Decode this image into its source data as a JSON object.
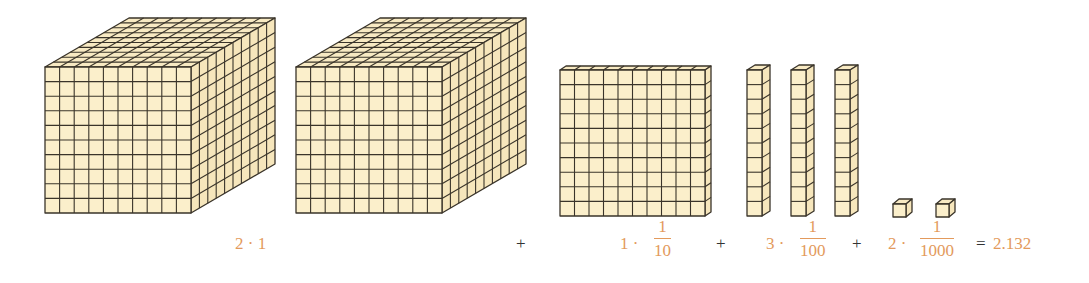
{
  "diagram": {
    "colors": {
      "fill": "#FBEFCB",
      "fill_side": "#F6E6BC",
      "fill_top": "#F8EAC3",
      "line": "#3A342A",
      "label_orange": "#E39A5C",
      "operator": "#333333"
    },
    "blocks": {
      "cubes": [
        {
          "name": "unit-cube-1",
          "x": 45,
          "y": 67,
          "size": 146,
          "dx": 84,
          "dy": -49,
          "n": 10
        },
        {
          "name": "unit-cube-2",
          "x": 296,
          "y": 67,
          "size": 146,
          "dx": 84,
          "dy": -49,
          "n": 10
        }
      ],
      "flats": [
        {
          "name": "tenth-flat",
          "x": 560,
          "y": 70,
          "w": 145,
          "h": 146,
          "dx": 6,
          "dy": -4,
          "n": 10
        }
      ],
      "rods": [
        {
          "name": "hundredth-rod-1",
          "x": 747,
          "y": 70,
          "w": 15,
          "h": 146,
          "dx": 8,
          "dy": -5,
          "n": 10
        },
        {
          "name": "hundredth-rod-2",
          "x": 791,
          "y": 70,
          "w": 15,
          "h": 146,
          "dx": 8,
          "dy": -5,
          "n": 10
        },
        {
          "name": "hundredth-rod-3",
          "x": 835,
          "y": 70,
          "w": 15,
          "h": 146,
          "dx": 8,
          "dy": -5,
          "n": 10
        }
      ],
      "units": [
        {
          "name": "thousandth-cube-1",
          "x": 893,
          "y": 204,
          "s": 13,
          "dx": 6,
          "dy": -5
        },
        {
          "name": "thousandth-cube-2",
          "x": 936,
          "y": 204,
          "s": 13,
          "dx": 6,
          "dy": -5
        }
      ]
    },
    "equation": {
      "term1": {
        "coef": "2 · 1"
      },
      "plus1": "+",
      "term2": {
        "coef": "1 ·",
        "num": "1",
        "den": "10"
      },
      "plus2": "+",
      "term3": {
        "coef": "3 ·",
        "num": "1",
        "den": "100"
      },
      "plus3": "+",
      "term4": {
        "coef": "2 ·",
        "num": "1",
        "den": "1000"
      },
      "equals": "=",
      "result": "2.132"
    }
  }
}
